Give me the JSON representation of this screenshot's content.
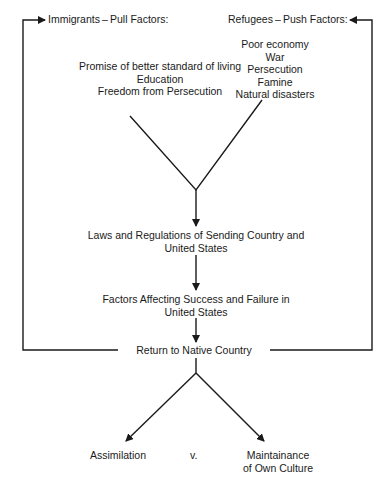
{
  "diagram": {
    "immigrants": {
      "title": "Immigrants – Pull Factors:",
      "factors": [
        "Promise of better standard of living",
        "Education",
        "Freedom from Persecution"
      ]
    },
    "refugees": {
      "title": "Refugees – Push Factors:",
      "factors": [
        "Poor economy",
        "War",
        "Persecution",
        "Famine",
        "Natural disasters"
      ]
    },
    "laws": [
      "Laws and Regulations of Sending Country and",
      "United States"
    ],
    "success": [
      "Factors Affecting Success and Failure in",
      "United States"
    ],
    "return": "Return to Native Country",
    "outcomes": {
      "assimilation": "Assimilation",
      "versus": "v.",
      "maintenance": [
        "Maintainance",
        "of Own Culture"
      ]
    }
  }
}
